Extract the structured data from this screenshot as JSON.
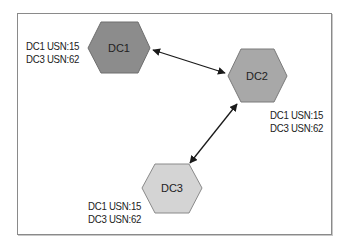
{
  "diagram": {
    "type": "replication-topology",
    "nodes": [
      {
        "id": "DC1",
        "label": "DC1",
        "fill": "#8c8c8c",
        "usn": [
          "DC1 USN:15",
          "DC3 USN:62"
        ]
      },
      {
        "id": "DC2",
        "label": "DC2",
        "fill": "#a8a8a8",
        "usn": [
          "DC1 USN:15",
          "DC3 USN:62"
        ]
      },
      {
        "id": "DC3",
        "label": "DC3",
        "fill": "#d4d4d4",
        "usn": [
          "DC1 USN:15",
          "DC3 USN:62"
        ]
      }
    ],
    "edges": [
      {
        "from": "DC1",
        "to": "DC2",
        "bidirectional": true
      },
      {
        "from": "DC2",
        "to": "DC3",
        "bidirectional": true
      }
    ],
    "colors": {
      "stroke": "#6e6e6e",
      "arrow": "#1a1a1a",
      "frame": "#8a8a8a"
    }
  }
}
